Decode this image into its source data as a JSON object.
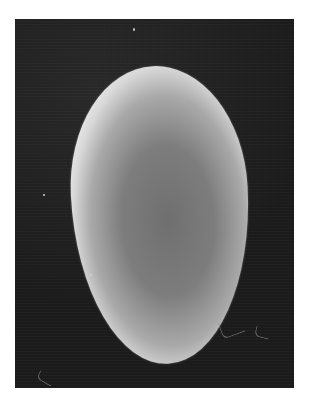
{
  "image": {
    "description": "Grayscale micrograph of a single ovoid egg on a dark background, framed by a white margin",
    "colors": {
      "margin": "#ffffff",
      "background": "#1c1c1c",
      "egg_rim": "#e6e6e6",
      "egg_center": "#6f6f6f"
    }
  }
}
